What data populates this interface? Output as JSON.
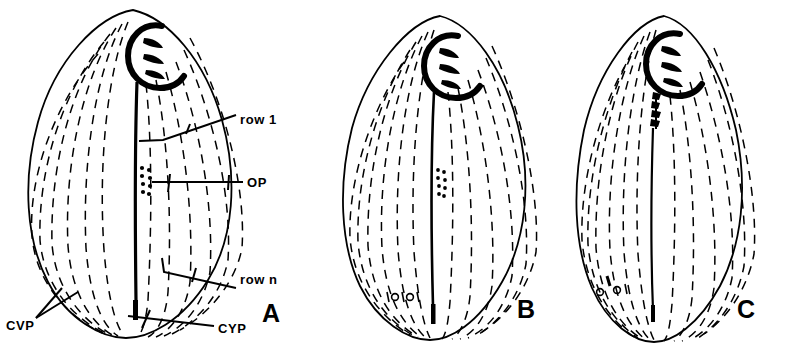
{
  "figure": {
    "background_color": "#ffffff",
    "ink_color": "#000000",
    "title": "",
    "panels": [
      {
        "letter": "A",
        "letter_x": 262,
        "letter_y": 322,
        "cell": {
          "cx": 130,
          "cy": 175,
          "rx": 105,
          "ry": 165,
          "shape": "pear-shaped ciliate cell, pointed anterior",
          "ciliary_rows": 13
        },
        "oral_apparatus": {
          "cx": 146,
          "cy": 52,
          "membranelles": 3
        },
        "oral_primordium_dots": 8,
        "cyp_mark": true
      },
      {
        "letter": "B",
        "letter_x": 517,
        "letter_y": 318,
        "cell": {
          "cx": 437,
          "cy": 178,
          "rx": 92,
          "ry": 162,
          "shape": "pear-shaped ciliate cell, pointed anterior",
          "ciliary_rows": 13
        },
        "oral_apparatus": {
          "cx": 440,
          "cy": 62,
          "membranelles": 3
        },
        "oral_primordium_dots": 8,
        "cvp_circles": 2,
        "cyp_mark": true
      },
      {
        "letter": "C",
        "letter_x": 737,
        "letter_y": 318,
        "cell": {
          "cx": 665,
          "cy": 180,
          "rx": 85,
          "ry": 163,
          "shape": "elongate ciliate cell, pointed anterior",
          "ciliary_rows": 13
        },
        "oral_apparatus": {
          "cx": 662,
          "cy": 60,
          "membranelles": 3
        },
        "oral_primordium_streak": true,
        "cvp_circles": 2,
        "cyp_mark": true
      }
    ],
    "labels": [
      {
        "id": "row1",
        "text": "row 1",
        "x": 240,
        "y": 124,
        "anchor": "start"
      },
      {
        "id": "op",
        "text": "OP",
        "x": 247,
        "y": 187,
        "anchor": "start"
      },
      {
        "id": "rown",
        "text": "row n",
        "x": 240,
        "y": 284,
        "anchor": "start"
      },
      {
        "id": "cvp",
        "text": "CVP",
        "x": 6,
        "y": 330,
        "anchor": "start"
      },
      {
        "id": "cyp",
        "text": "CYP",
        "x": 218,
        "y": 333,
        "anchor": "start"
      }
    ]
  }
}
